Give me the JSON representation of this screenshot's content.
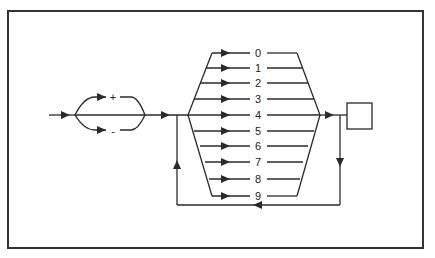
{
  "diagram": {
    "type": "syntax-railroad-diagram",
    "sign_options": [
      "+",
      "-"
    ],
    "digits": [
      "0",
      "1",
      "2",
      "3",
      "4",
      "5",
      "6",
      "7",
      "8",
      "9"
    ],
    "terminal_box": "",
    "loop": "repeat digits",
    "colors": {
      "line": "#2a2a2a",
      "frame": "#333333",
      "background": "#ffffff"
    }
  },
  "caption": {
    "text": ""
  }
}
